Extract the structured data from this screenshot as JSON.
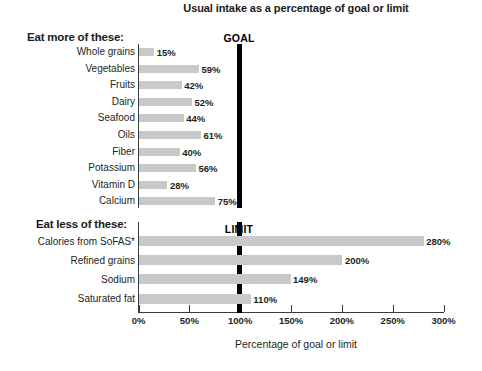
{
  "chart_data": {
    "type": "bar",
    "orientation": "horizontal",
    "title": "Usual intake as a percentage of goal or limit",
    "xlabel": "Percentage of goal or limit",
    "ylabel": "",
    "xlim": [
      0,
      300
    ],
    "grid": false,
    "legend": null,
    "tick_labels": [
      "0%",
      "50%",
      "100%",
      "150%",
      "200%",
      "250%",
      "300%"
    ],
    "tick_values": [
      0,
      50,
      100,
      150,
      200,
      250,
      300
    ],
    "reference_lines": [
      {
        "name": "goal-line",
        "label": "GOAL",
        "value": 100,
        "color": "#000000",
        "section": "eat-more"
      },
      {
        "name": "limit-line",
        "label": "LIMIT",
        "value": 100,
        "color": "#000000",
        "section": "eat-less"
      }
    ],
    "bar_color": "#c9c9c9",
    "sections": [
      {
        "heading": "Eat more of these:",
        "categories": [
          "Whole grains",
          "Vegetables",
          "Fruits",
          "Dairy",
          "Seafood",
          "Oils",
          "Fiber",
          "Potassium",
          "Vitamin D",
          "Calcium"
        ],
        "values": [
          15,
          59,
          42,
          52,
          44,
          61,
          40,
          56,
          28,
          75
        ],
        "value_labels": [
          "15%",
          "59%",
          "42%",
          "52%",
          "44%",
          "61%",
          "40%",
          "56%",
          "28%",
          "75%"
        ]
      },
      {
        "heading": "Eat less of these:",
        "categories": [
          "Calories from SoFAS*",
          "Refined grains",
          "Sodium",
          "Saturated fat"
        ],
        "values": [
          280,
          200,
          149,
          110
        ],
        "value_labels": [
          "280%",
          "200%",
          "149%",
          "110%"
        ]
      }
    ]
  },
  "title": "Usual intake as a percentage of goal or limit",
  "axis_caption": "Percentage of goal or limit",
  "headings": {
    "eat_more": "Eat more of these:",
    "eat_less": "Eat less of these:"
  },
  "reference": {
    "goal": "GOAL",
    "limit": "LIMIT"
  },
  "ticks": [
    {
      "label": "0%"
    },
    {
      "label": "50%"
    },
    {
      "label": "100%"
    },
    {
      "label": "150%"
    },
    {
      "label": "200%"
    },
    {
      "label": "250%"
    },
    {
      "label": "300%"
    }
  ],
  "rows_more": [
    {
      "label": "Whole grains",
      "value_label": "15%"
    },
    {
      "label": "Vegetables",
      "value_label": "59%"
    },
    {
      "label": "Fruits",
      "value_label": "42%"
    },
    {
      "label": "Dairy",
      "value_label": "52%"
    },
    {
      "label": "Seafood",
      "value_label": "44%"
    },
    {
      "label": "Oils",
      "value_label": "61%"
    },
    {
      "label": "Fiber",
      "value_label": "40%"
    },
    {
      "label": "Potassium",
      "value_label": "56%"
    },
    {
      "label": "Vitamin D",
      "value_label": "28%"
    },
    {
      "label": "Calcium",
      "value_label": "75%"
    }
  ],
  "rows_less": [
    {
      "label": "Calories from SoFAS*",
      "value_label": "280%"
    },
    {
      "label": "Refined grains",
      "value_label": "200%"
    },
    {
      "label": "Sodium",
      "value_label": "149%"
    },
    {
      "label": "Saturated fat",
      "value_label": "110%"
    }
  ]
}
